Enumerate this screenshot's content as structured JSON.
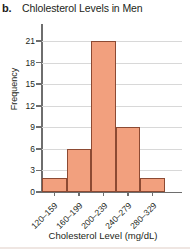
{
  "panel": {
    "label": "b."
  },
  "chart_data": {
    "type": "bar",
    "title": "Chlolesterol Levels in Men",
    "xlabel": "Cholesterol Level (mg/dL)",
    "ylabel": "Frequency",
    "categories": [
      "120–159",
      "160–199",
      "200–239",
      "240–279",
      "280–329"
    ],
    "values": [
      2,
      6,
      21,
      9,
      2
    ],
    "ylim": [
      0,
      21
    ],
    "ytick_labels": [
      "0",
      "3",
      "6",
      "9",
      "12",
      "15",
      "18",
      "21"
    ],
    "ytick_values": [
      0,
      3,
      6,
      9,
      12,
      15,
      18,
      21
    ],
    "grid": "horizontal",
    "legend": "none",
    "bar_fill_color": "#f2a07e",
    "bar_edge_color": "#8c4a33",
    "axis_color": "#6e6e6e",
    "gridline_color": "#d8d8d8",
    "background_color": "#ffffff",
    "text_color": "#231f20",
    "xtick_label_rotation": -45,
    "bars_contiguous": true
  }
}
